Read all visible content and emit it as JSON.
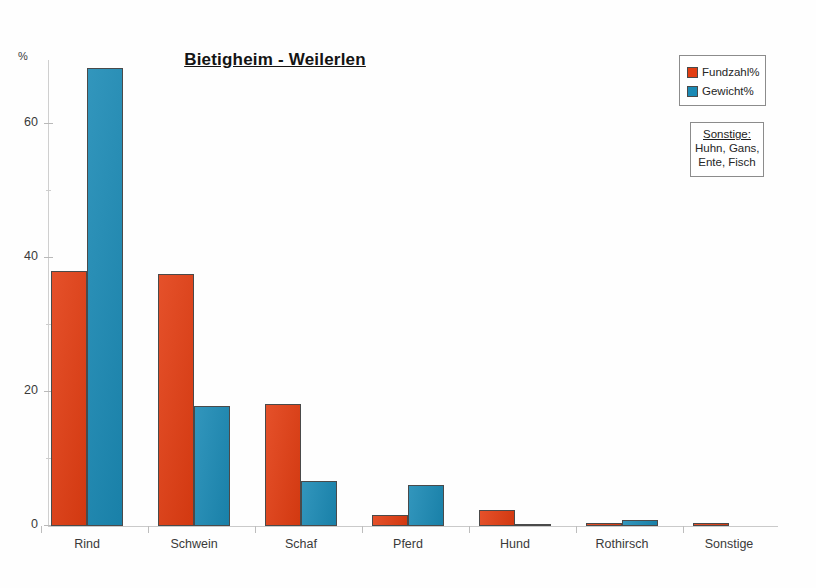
{
  "chart_data": {
    "type": "bar",
    "title": "Bietigheim - Weilerlen",
    "xlabel": "",
    "ylabel": "%",
    "ylim": [
      0,
      70
    ],
    "yticks": [
      0,
      20,
      40,
      60
    ],
    "yticks_minor": [
      10,
      30,
      50
    ],
    "grid": false,
    "legend_position": "top-right",
    "categories": [
      "Rind",
      "Schwein",
      "Schaf",
      "Pferd",
      "Hund",
      "Rothirsch",
      "Sonstige"
    ],
    "series": [
      {
        "name": "Fundzahl%",
        "color": "#e23d12",
        "values": [
          38.0,
          37.6,
          18.2,
          1.6,
          2.4,
          0.5,
          0.5
        ]
      },
      {
        "name": "Gewicht%",
        "color": "#1b8ab5",
        "values": [
          68.3,
          17.9,
          6.7,
          6.1,
          0.3,
          0.9,
          0.0
        ]
      }
    ],
    "annotations": {
      "note_title": "Sonstige:",
      "note_lines": [
        "Huhn, Gans,",
        "Ente, Fisch"
      ]
    }
  },
  "axis": {
    "y_unit_label": "%",
    "tick_labels": [
      "60",
      "40",
      "20",
      "0"
    ]
  },
  "legend": {
    "entries": [
      {
        "label": "Fundzahl%",
        "swatch": "legend-swatch-red"
      },
      {
        "label": "Gewicht%",
        "swatch": "legend-swatch-blue"
      }
    ]
  },
  "colors": {
    "fundzahl": "#e23d12",
    "gewicht": "#1b8ab5",
    "axis": "#c8c8c8",
    "text": "#2b2b2b"
  }
}
